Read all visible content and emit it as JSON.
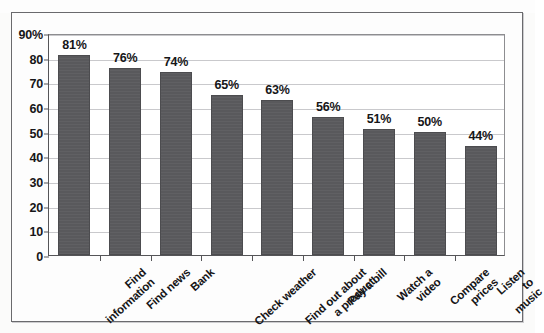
{
  "figure": {
    "background_color": "#fbfbfa",
    "frame_color": "#6a6a6d",
    "bar_color": "#59595c",
    "gridline_color": "#c9c9cc",
    "axis_color": "#555558"
  },
  "chart_data": {
    "type": "bar",
    "title": "",
    "subtitle": "",
    "xlabel": "",
    "ylabel": "",
    "ylim": [
      0,
      90
    ],
    "grid": true,
    "legend": "none",
    "orientation": "vertical",
    "categories": [
      "Find\ninformation",
      "Find news",
      "Bank",
      "Check weather",
      "Find out about\na product",
      "Pay a bill",
      "Watch a\nvideo",
      "Compare\nprices",
      "Listen\nto music"
    ],
    "values": [
      81,
      76,
      74,
      65,
      63,
      56,
      51,
      50,
      44
    ],
    "value_labels": [
      "81%",
      "76%",
      "74%",
      "65%",
      "63%",
      "56%",
      "51%",
      "50%",
      "44%"
    ],
    "ytick_values": [
      90,
      80,
      70,
      60,
      50,
      40,
      30,
      20,
      10,
      0
    ],
    "ytick_labels": [
      "90%",
      "80",
      "70",
      "60",
      "50",
      "40",
      "30",
      "20",
      "10",
      "0"
    ]
  }
}
